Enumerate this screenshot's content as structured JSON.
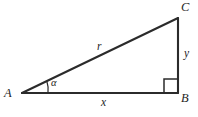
{
  "figure": {
    "type": "right-triangle-diagram",
    "caption": "Right triangle ABC with right angle at B",
    "stroke_color": "#2b2b2b",
    "background_color": "#ffffff",
    "vertices": [
      {
        "id": "A",
        "label": "A",
        "x": 22,
        "y": 93,
        "label_x": 4,
        "label_y": 88
      },
      {
        "id": "B",
        "label": "B",
        "x": 178,
        "y": 93,
        "label_x": 181,
        "label_y": 93
      },
      {
        "id": "C",
        "label": "C",
        "x": 178,
        "y": 18,
        "label_x": 181,
        "label_y": 2
      }
    ],
    "sides": [
      {
        "id": "hypotenuse",
        "from": "A",
        "to": "C",
        "label": "r",
        "label_x": 97,
        "label_y": 42
      },
      {
        "id": "base",
        "from": "A",
        "to": "B",
        "label": "x",
        "label_x": 101,
        "label_y": 98
      },
      {
        "id": "vertical",
        "from": "B",
        "to": "C",
        "label": "y",
        "label_x": 184,
        "label_y": 49
      }
    ],
    "angles": [
      {
        "id": "alpha",
        "at": "A",
        "label": "α",
        "label_x": 51,
        "label_y": 79,
        "arc_radius": 26
      },
      {
        "id": "right-angle",
        "at": "B",
        "label": "",
        "marker": "square",
        "marker_size": 14
      }
    ]
  }
}
